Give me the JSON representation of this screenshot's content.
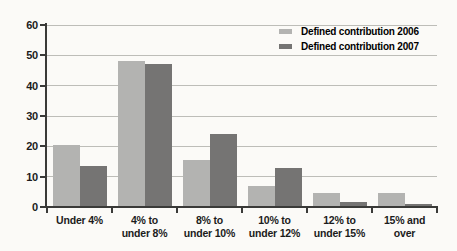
{
  "colors": {
    "background": "#fbfaf7",
    "grid": "#bdbdb8",
    "axis": "#3a3a38",
    "text": "#1c1c1c"
  },
  "legend": {
    "position": "top-right",
    "items": [
      {
        "label": "Defined contribution 2006",
        "color": "#b3b3b1"
      },
      {
        "label": "Defined contribution 2007",
        "color": "#757473"
      }
    ]
  },
  "chart_data": {
    "type": "bar",
    "title": "",
    "xlabel": "",
    "ylabel": "",
    "categories": [
      "Under 4%",
      "4% to under 8%",
      "8% to under 10%",
      "10% to under 12%",
      "12% to under 15%",
      "15% and over"
    ],
    "categories_lines": [
      [
        "Under 4%"
      ],
      [
        "4% to",
        "under 8%"
      ],
      [
        "8% to",
        "under 10%"
      ],
      [
        "10% to",
        "under 12%"
      ],
      [
        "12% to",
        "under 15%"
      ],
      [
        "15% and",
        "over"
      ]
    ],
    "series": [
      {
        "name": "Defined contribution 2006",
        "color": "#b3b3b1",
        "values": [
          20.5,
          48,
          15.5,
          7,
          4.5,
          4.5
        ]
      },
      {
        "name": "Defined contribution 2007",
        "color": "#757473",
        "values": [
          13.5,
          47,
          24,
          13,
          1.5,
          1
        ]
      }
    ],
    "ylim": [
      0,
      60
    ],
    "yticks": [
      0,
      10,
      20,
      30,
      40,
      50,
      60
    ],
    "ytick_labels": [
      "0",
      "10",
      "20",
      "30",
      "40",
      "50",
      "60"
    ],
    "grid": true,
    "legend_position": "top-right"
  }
}
